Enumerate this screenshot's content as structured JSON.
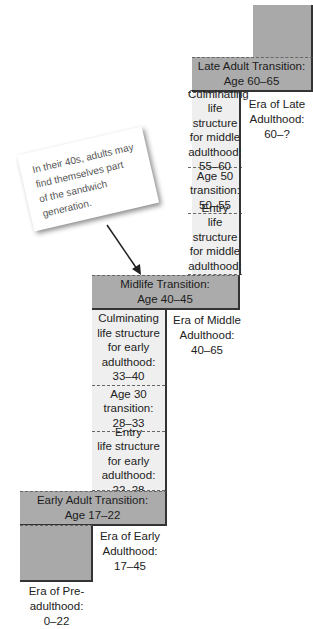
{
  "diagram": {
    "transitions": [
      {
        "id": "late",
        "title": "Late Adult Transition:",
        "age": "Age 60–65"
      },
      {
        "id": "midlife",
        "title": "Midlife Transition:",
        "age": "Age 40–45"
      },
      {
        "id": "early",
        "title": "Early Adult Transition:",
        "age": "Age 17–22"
      }
    ],
    "middle_adulthood_stages": [
      {
        "lines": [
          "Culminating",
          "life structure",
          "for middle",
          "adulthood:",
          "55–60"
        ]
      },
      {
        "lines": [
          "Age 50",
          "transition:",
          "50–55"
        ]
      },
      {
        "lines": [
          "Entry",
          "life structure",
          "for middle",
          "adulthood:",
          "45–50"
        ]
      }
    ],
    "early_adulthood_stages": [
      {
        "lines": [
          "Culminating",
          "life structure",
          "for early",
          "adulthood:",
          "33–40"
        ]
      },
      {
        "lines": [
          "Age 30",
          "transition:",
          "28–33"
        ]
      },
      {
        "lines": [
          "Entry",
          "life structure",
          "for early",
          "adulthood:",
          "22–28"
        ]
      }
    ],
    "eras": {
      "late": [
        "Era of Late",
        "Adulthood:",
        "60–?"
      ],
      "middle": [
        "Era of Middle",
        "Adulthood:",
        "40–65"
      ],
      "early": [
        "Era of Early",
        "Adulthood:",
        "17–45"
      ],
      "pre": [
        "Era of Pre-",
        "adulthood:",
        "0–22"
      ]
    },
    "callout": {
      "lines": [
        "In their 40s, adults may",
        "find themselves part",
        "of the sandwich",
        "generation."
      ]
    },
    "colors": {
      "transition_fill": "#ababab",
      "stage_fill": "#efefef",
      "border": "#333333"
    }
  }
}
